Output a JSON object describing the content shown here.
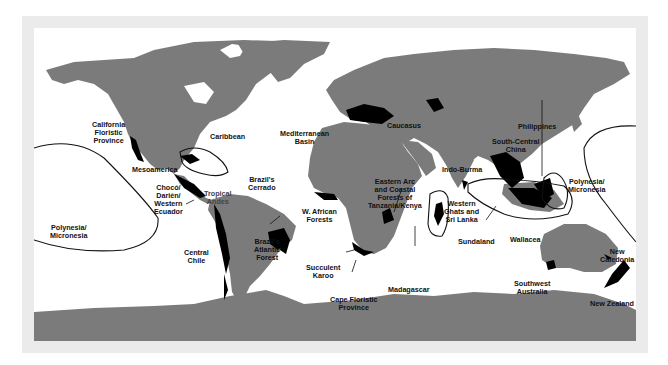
{
  "map": {
    "title": "Biodiversity Hotspots",
    "colors": {
      "frame": "#ebebeb",
      "ocean": "#ffffff",
      "land": "#7b7b7b",
      "hotspot": "#000000",
      "outline": "#111111"
    },
    "labels": {
      "california": "California\nFloristic\nProvince",
      "caribbean": "Caribbean",
      "mesoamerica": "Mesoamerica",
      "choco": "Chocó/\nDarién/\nWestern\nEcuador",
      "tropical_andes": "Tropical\nAndes",
      "cerrado": "Brazil's\nCerrado",
      "atlantic_forest": "Brazil's\nAtlantic\nForest",
      "central_chile": "Central\nChile",
      "polynesia_west": "Polynesia/\nMicronesia",
      "mediterranean": "Mediterranean\nBasin",
      "caucasus": "Caucasus",
      "west_african": "W. African\nForests",
      "eastern_arc": "Eastern Arc\nand Coastal\nForests of\nTanzania/Kenya",
      "succulent_karoo": "Succulent\nKaroo",
      "cape_floristic": "Cape Floristic\nProvince",
      "madagascar": "Madagascar",
      "south_central_china": "South-Central\nChina",
      "indo_burma": "Indo-Burma",
      "western_ghats": "Western\nGhats and\nSri Lanka",
      "philippines": "Philippines",
      "sundaland": "Sundaland",
      "wallacea": "Wallacea",
      "polynesia_east": "Polynesia/\nMicronesia",
      "new_caledonia": "New\nCaledonia",
      "southwest_australia": "Southwest\nAustralia",
      "new_zealand": "New Zealand"
    }
  }
}
